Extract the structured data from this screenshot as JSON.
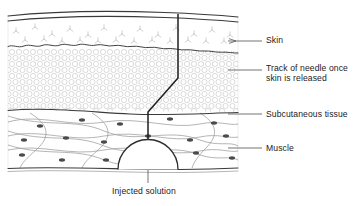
{
  "figure": {
    "colors": {
      "outline": "#3a3a3a",
      "texture": "#b9b9b9",
      "nucleus": "#4a4a4a",
      "needle": "#1f1f1f",
      "label_text": "#1b1b1b",
      "leader": "#5a5a5a",
      "background": "#ffffff"
    }
  },
  "labels": [
    {
      "id": "skin",
      "text": "Skin",
      "x": 266,
      "y": 35,
      "leader_x1": 228,
      "leader_x2": 262,
      "leader_y": 41,
      "arrow": true
    },
    {
      "id": "needle-track",
      "text": "Track of needle once\nskin is released",
      "x": 266,
      "y": 64,
      "leader_x1": 228,
      "leader_x2": 262,
      "leader_y": 70,
      "arrow": false
    },
    {
      "id": "subcutaneous",
      "text": "Subcutaneous tissue",
      "x": 266,
      "y": 110,
      "leader_x1": 228,
      "leader_x2": 262,
      "leader_y": 114,
      "arrow": false
    },
    {
      "id": "muscle",
      "text": "Muscle",
      "x": 266,
      "y": 144,
      "leader_x1": 228,
      "leader_x2": 262,
      "leader_y": 148,
      "arrow": false
    }
  ],
  "caption": {
    "id": "injected-solution",
    "text": "Injected solution",
    "x": 112,
    "y": 186,
    "leader_x": 148,
    "leader_y1": 170,
    "leader_y2": 183
  },
  "layers": [
    {
      "id": "epidermis",
      "name": "Epidermis surface lines",
      "top": 14,
      "bottom": 22
    },
    {
      "id": "dermis",
      "name": "Dermis",
      "top": 22,
      "bottom": 45
    },
    {
      "id": "subcutaneous",
      "name": "Subcutaneous tissue",
      "top": 45,
      "bottom": 112
    },
    {
      "id": "muscle",
      "name": "Muscle",
      "top": 112,
      "bottom": 170
    }
  ],
  "needle_track": {
    "name": "needle track",
    "entry_x": 178,
    "entry_y": 14,
    "bend_top_y": 78,
    "bend_bottom_y": 112,
    "lower_x": 148,
    "tip_y": 144
  },
  "bolus": {
    "name": "injected solution dome",
    "center_x": 148,
    "base_y": 170,
    "radius": 30
  },
  "diagram_bounds": {
    "left": 8,
    "right": 238,
    "top": 12,
    "bottom": 172
  }
}
